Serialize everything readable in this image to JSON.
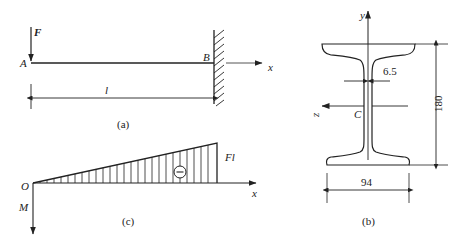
{
  "figure_a": {
    "caption": "(a)",
    "force_label": "F",
    "point_a_label": "A",
    "point_b_label": "B",
    "axis_x_label": "x",
    "length_label": "l",
    "support": "fixed wall at B"
  },
  "figure_b": {
    "caption": "(b)",
    "axis_y_label": "y",
    "axis_z_label": "z",
    "centroid_label": "C",
    "web_thickness_label": "6.5",
    "height_label": "180",
    "flange_width_label": "94"
  },
  "figure_c": {
    "caption": "(c)",
    "origin_label": "O",
    "axis_x_label": "x",
    "axis_m_label": "M",
    "max_moment_label": "Fl",
    "sign_label": "−"
  },
  "colors": {
    "line": "#222222",
    "background": "#ffffff"
  }
}
